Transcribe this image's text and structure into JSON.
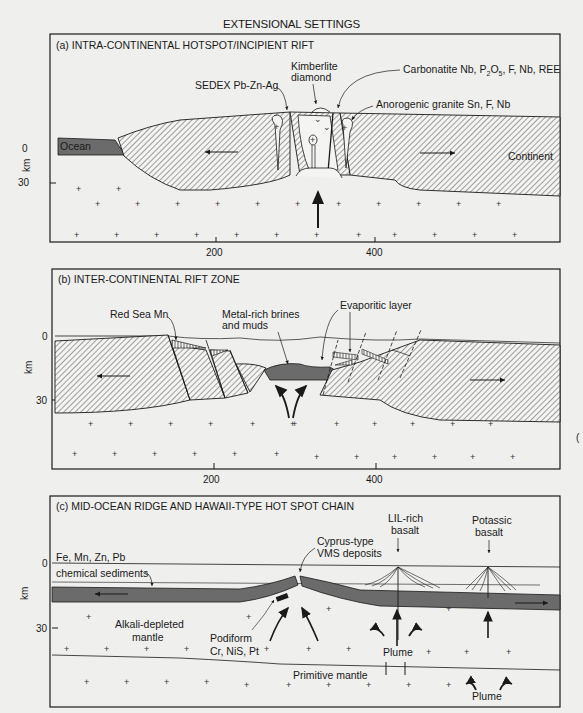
{
  "title": "EXTENSIONAL SETTINGS",
  "axis": {
    "ylabel": "km",
    "y_ticks": [
      "0",
      "30"
    ],
    "x_ticks": [
      "200",
      "400"
    ]
  },
  "panels": [
    {
      "id": "a",
      "title": "(a) INTRA-CONTINENTAL HOTSPOT/INCIPIENT RIFT",
      "labels": {
        "sedex": "SEDEX Pb-Zn-Ag",
        "kimberlite_1": "Kimberlite",
        "kimberlite_2": "diamond",
        "carbonatite": "Carbonatite Nb, P",
        "carbonatite_sub": "2",
        "carbonatite_mid": "O",
        "carbonatite_sub2": "5",
        "carbonatite_end": ", F, Nb, REE",
        "granite": "Anorogenic granite Sn, F, Nb",
        "ocean": "Ocean",
        "continent": "Continent"
      }
    },
    {
      "id": "b",
      "title": "(b) INTER-CONTINENTAL RIFT ZONE",
      "labels": {
        "red_sea": "Red Sea Mn",
        "brines_1": "Metal-rich brines",
        "brines_2": "and muds",
        "evaporitic": "Evaporitic layer"
      }
    },
    {
      "id": "c",
      "title": "(c) MID-OCEAN RIDGE AND HAWAII-TYPE HOT SPOT CHAIN",
      "labels": {
        "metals": "Fe, Mn,  Zn, Pb",
        "chem_sed": "chemical sediments",
        "cyprus_1": "Cyprus-type",
        "cyprus_2": "VMS deposits",
        "lil_1": "LIL-rich",
        "lil_2": "basalt",
        "potassic_1": "Potassic",
        "potassic_2": "basalt",
        "alkali_1": "Alkali-depleted",
        "alkali_2": "mantle",
        "podiform_1": "Podiform",
        "podiform_2": "Cr, NiS, Pt",
        "plume_1": "Plume",
        "plume_2": "Plume",
        "primitive": "Primitive mantle"
      }
    }
  ],
  "colors": {
    "background": "#efefed",
    "line": "#1a1a1a",
    "oceanic_crust": "#6b6b6b",
    "hatch": "#555555"
  }
}
